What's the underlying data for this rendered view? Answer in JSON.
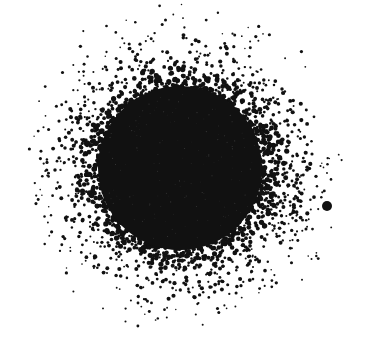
{
  "image": {
    "width": 377,
    "height": 345,
    "background": "#ffffff",
    "ink": "#111111",
    "description": "Stippled black circular blob fading outward into scattered dots"
  },
  "blob": {
    "center_x": 180,
    "center_y": 168,
    "core_radius": 82,
    "halo_outer_radius": 172,
    "seed": 1337,
    "dot_count": 2600
  },
  "isolated_dot": {
    "cx": 327,
    "cy": 206,
    "r": 5
  }
}
